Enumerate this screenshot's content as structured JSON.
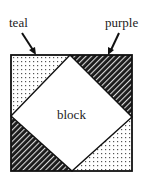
{
  "diagram": {
    "type": "quilt-block-schematic",
    "labels": {
      "top_left": "teal",
      "top_right": "purple",
      "center": "block"
    },
    "regions": [
      {
        "name": "teal-top-left",
        "pattern": "dotted",
        "position": "top-left corner triangle"
      },
      {
        "name": "purple-top-right",
        "pattern": "hatched",
        "position": "top-right corner triangle"
      },
      {
        "name": "purple-bottom-left",
        "pattern": "hatched",
        "position": "bottom-left corner triangle"
      },
      {
        "name": "teal-bottom-right",
        "pattern": "dotted",
        "position": "bottom-right corner triangle"
      },
      {
        "name": "block-center",
        "pattern": "white",
        "position": "center diamond"
      }
    ],
    "colors": {
      "outline": "#111111",
      "hatch_dark": "#1a1a1a",
      "hatch_light": "#d8d8d8",
      "dots": "#555555",
      "background": "#ffffff"
    }
  }
}
